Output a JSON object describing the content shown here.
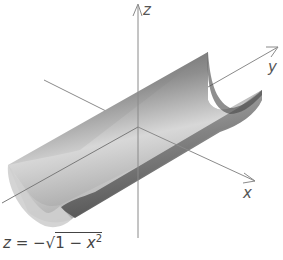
{
  "figure": {
    "type": "3d-surface-diagram",
    "surface": "half cylinder (trough) opening upward, extending along y-axis",
    "axes": {
      "z_label": "z",
      "y_label": "y",
      "x_label": "x"
    },
    "equation": {
      "lhs": "z",
      "eq": "=",
      "neg": "−",
      "radicand_one": "1",
      "minus": "−",
      "var": "x",
      "exp": "2"
    },
    "colors": {
      "axis": "#8a8a8a",
      "surface_dark": "#555555",
      "surface_light": "#e6e6e6",
      "text": "#555555"
    }
  }
}
